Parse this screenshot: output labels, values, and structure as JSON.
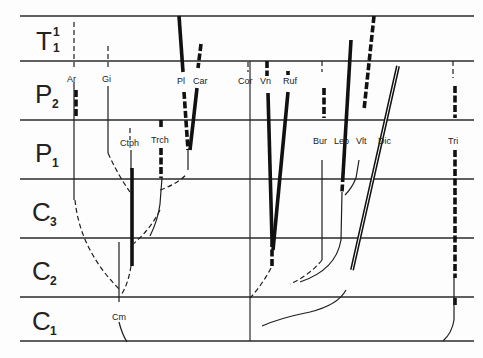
{
  "figure": {
    "type": "stratigraphic range / phylogeny diagram",
    "stages": [
      {
        "letter": "T",
        "sub": "1",
        "sup": "1"
      },
      {
        "letter": "P",
        "sub": "2",
        "sup": ""
      },
      {
        "letter": "P",
        "sub": "1",
        "sup": ""
      },
      {
        "letter": "C",
        "sub": "3",
        "sup": ""
      },
      {
        "letter": "C",
        "sub": "2",
        "sup": ""
      },
      {
        "letter": "C",
        "sub": "1",
        "sup": ""
      }
    ],
    "taxa": {
      "ar": "Ar",
      "gi": "Gi",
      "ctph": "Ctph",
      "trch": "Trch",
      "pl": "Pl",
      "car": "Car",
      "cm": "Cm",
      "cor": "Cor",
      "vn": "Vn",
      "ruf": "Ruf",
      "bur": "Bur",
      "leb": "Leb",
      "vit": "Vlt",
      "dic": "Dic",
      "tri": "Tri"
    }
  }
}
